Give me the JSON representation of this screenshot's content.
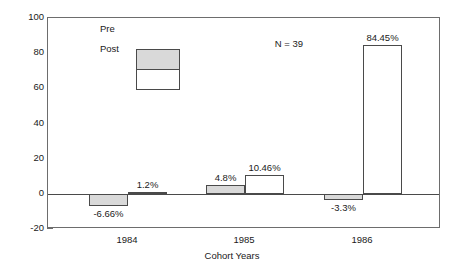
{
  "chart_data": {
    "type": "bar",
    "title": "",
    "xlabel": "Cohort Years",
    "ylabel": "",
    "categories": [
      "1984",
      "1985",
      "1986"
    ],
    "ylim": [
      -20,
      100
    ],
    "yticks": [
      100,
      80,
      60,
      40,
      20,
      0,
      -20
    ],
    "ytick_labels": [
      "100",
      "80",
      "60",
      "40",
      "20",
      "0",
      "-20"
    ],
    "grid": false,
    "legend_position": "upper-left",
    "annotations": [
      {
        "text": "N = 39",
        "position": "top-center"
      }
    ],
    "series": [
      {
        "name": "Pre",
        "color": "#d9d9d9",
        "values": [
          -6.66,
          4.8,
          -3.3
        ],
        "labels": [
          "-6.66%",
          "4.8%",
          "-3.3%"
        ]
      },
      {
        "name": "Post",
        "color": "#ffffff",
        "values": [
          1.2,
          10.46,
          84.45
        ],
        "labels": [
          "1.2%",
          "10.46%",
          "84.45%"
        ]
      }
    ]
  },
  "legend": {
    "entries": [
      {
        "label": "Pre",
        "swatch": "#d9d9d9"
      },
      {
        "label": "Post",
        "swatch": "#ffffff"
      }
    ]
  },
  "annotation": {
    "sample_size": "N = 39"
  },
  "axes": {
    "x_title": "Cohort Years"
  }
}
